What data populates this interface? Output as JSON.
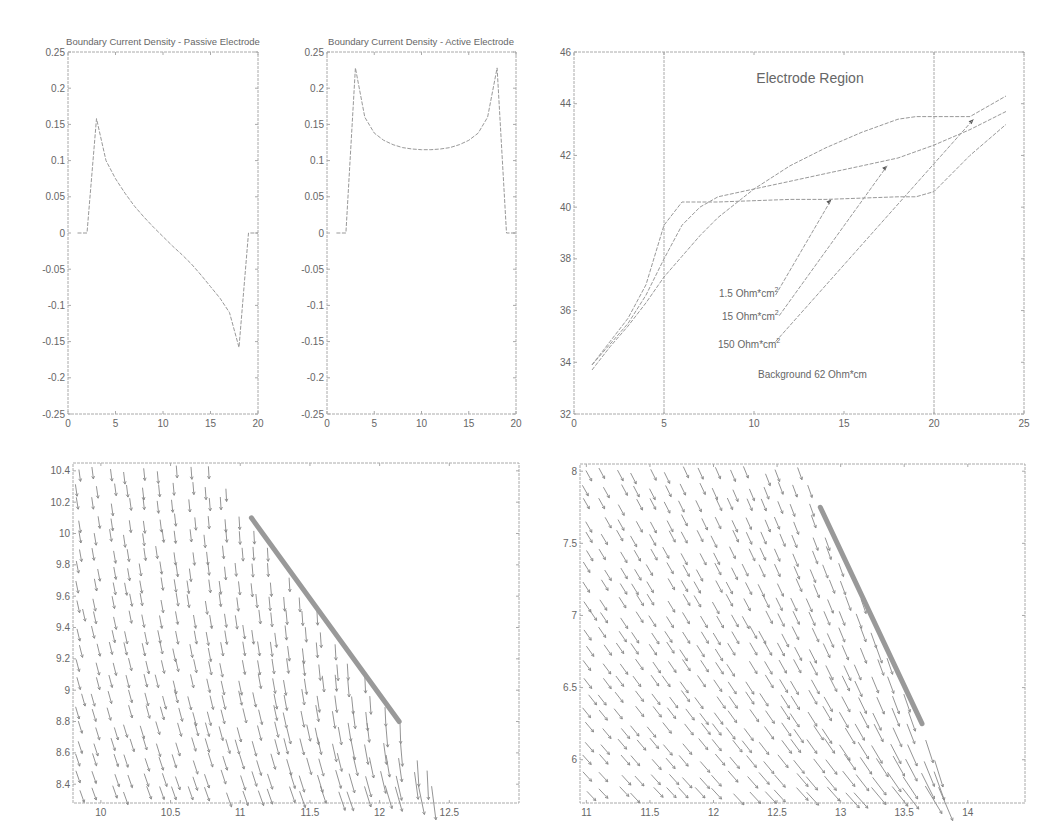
{
  "colors": {
    "background": "#ffffff",
    "axes": "#aaaaaa",
    "text": "#666666",
    "curve": "#999999",
    "electrode": "#999999"
  },
  "chart_data": [
    {
      "id": "passive",
      "type": "line",
      "title": "Boundary Current Density - Passive Electrode",
      "xlabel": "",
      "ylabel": "",
      "xlim": [
        0,
        20
      ],
      "ylim": [
        -0.25,
        0.25
      ],
      "xticks": [
        "0",
        "5",
        "10",
        "15",
        "20"
      ],
      "yticks": [
        "0.25",
        "0.2",
        "0.15",
        "0.1",
        "0.05",
        "0",
        "-0.05",
        "-0.1",
        "-0.15",
        "-0.2",
        "-0.25"
      ],
      "grid": false,
      "series": [
        {
          "name": "passive",
          "x": [
            1,
            2,
            3,
            4,
            5,
            6,
            7,
            8,
            9,
            10,
            11,
            12,
            13,
            14,
            15,
            16,
            17,
            18,
            19,
            20
          ],
          "y": [
            0,
            0,
            0.158,
            0.1,
            0.075,
            0.055,
            0.037,
            0.022,
            0.008,
            -0.005,
            -0.018,
            -0.03,
            -0.043,
            -0.058,
            -0.074,
            -0.09,
            -0.11,
            -0.158,
            0,
            0
          ]
        }
      ]
    },
    {
      "id": "active",
      "type": "line",
      "title": "Boundary Current Density - Active Electrode",
      "xlabel": "",
      "ylabel": "",
      "xlim": [
        0,
        20
      ],
      "ylim": [
        -0.25,
        0.25
      ],
      "xticks": [
        "0",
        "5",
        "10",
        "15",
        "20"
      ],
      "yticks": [
        "0.25",
        "0.2",
        "0.15",
        "0.1",
        "0.05",
        "0",
        "-0.05",
        "-0.1",
        "-0.15",
        "-0.2",
        "-0.25"
      ],
      "grid": false,
      "series": [
        {
          "name": "active",
          "x": [
            1,
            2,
            3,
            4,
            5,
            6,
            7,
            8,
            9,
            10,
            11,
            12,
            13,
            14,
            15,
            16,
            17,
            18,
            19,
            20
          ],
          "y": [
            0,
            0,
            0.228,
            0.16,
            0.138,
            0.128,
            0.122,
            0.118,
            0.116,
            0.115,
            0.115,
            0.116,
            0.118,
            0.122,
            0.128,
            0.138,
            0.16,
            0.228,
            0,
            0
          ]
        }
      ]
    },
    {
      "id": "electrode-region",
      "type": "line",
      "title": "Electrode Region",
      "xlabel": "",
      "ylabel": "",
      "xlim": [
        0,
        25
      ],
      "ylim": [
        32,
        46
      ],
      "xticks": [
        "0",
        "5",
        "10",
        "15",
        "20",
        "25"
      ],
      "yticks": [
        "46",
        "44",
        "42",
        "40",
        "38",
        "36",
        "34",
        "32"
      ],
      "grid": false,
      "vlines": [
        5,
        20
      ],
      "annotations": [
        {
          "text": "1.5 Ohm*cm",
          "sup": "2",
          "x": 7.6,
          "y": 36.8
        },
        {
          "text": "15 Ohm*cm",
          "sup": "2",
          "x": 7.8,
          "y": 36.0
        },
        {
          "text": "150 Ohm*cm",
          "sup": "2",
          "x": 7.6,
          "y": 35.0
        },
        {
          "text": "Background 62 Ohm*cm",
          "sup": "",
          "x": 10.5,
          "y": 33.8
        }
      ],
      "series": [
        {
          "name": "1.5 Ohm*cm^2",
          "x": [
            1,
            2,
            3,
            4,
            5,
            6,
            8,
            10,
            12,
            14,
            16,
            18,
            19,
            20,
            22,
            24
          ],
          "y": [
            33.9,
            34.8,
            35.7,
            37.0,
            39.3,
            40.2,
            40.2,
            40.25,
            40.3,
            40.3,
            40.35,
            40.4,
            40.4,
            40.6,
            42.0,
            43.2
          ]
        },
        {
          "name": "15 Ohm*cm^2",
          "x": [
            1,
            2,
            3,
            4,
            5,
            6,
            7,
            8,
            10,
            12,
            14,
            16,
            18,
            20,
            22,
            24
          ],
          "y": [
            33.9,
            34.7,
            35.5,
            36.6,
            38.0,
            39.3,
            40.0,
            40.4,
            40.7,
            41.0,
            41.3,
            41.6,
            41.9,
            42.4,
            43.0,
            43.7
          ]
        },
        {
          "name": "150 Ohm*cm^2",
          "x": [
            1,
            2,
            3,
            4,
            5,
            6,
            7,
            8,
            10,
            12,
            14,
            16,
            18,
            19,
            20,
            22,
            24
          ],
          "y": [
            33.7,
            34.6,
            35.4,
            36.3,
            37.3,
            38.1,
            38.9,
            39.6,
            40.7,
            41.6,
            42.3,
            42.9,
            43.4,
            43.5,
            43.5,
            43.5,
            44.3
          ]
        }
      ]
    },
    {
      "id": "quiver-left",
      "type": "quiver",
      "title": "",
      "xlim": [
        9.8,
        13.0
      ],
      "ylim": [
        8.28,
        10.45
      ],
      "xticks": [
        "10",
        "10.5",
        "11",
        "11.5",
        "12",
        "12.5"
      ],
      "yticks": [
        "10.4",
        "10.2",
        "10",
        "9.8",
        "9.6",
        "9.4",
        "9.2",
        "9",
        "8.8",
        "8.6",
        "8.4"
      ],
      "electrode_segment": {
        "x1": 11.08,
        "y1": 10.1,
        "x2": 12.14,
        "y2": 8.8
      },
      "field_description": "current density vectors pointing down/left, converging toward electrode end near (12.5, 8.28)"
    },
    {
      "id": "quiver-right",
      "type": "quiver",
      "title": "",
      "xlim": [
        10.95,
        14.45
      ],
      "ylim": [
        5.7,
        8.05
      ],
      "xticks": [
        "11",
        "11.5",
        "12",
        "12.5",
        "13",
        "13.5",
        "14"
      ],
      "yticks": [
        "8",
        "7.5",
        "7",
        "6.5",
        "6"
      ],
      "electrode_segment": {
        "x1": 12.84,
        "y1": 7.75,
        "x2": 13.64,
        "y2": 6.25
      },
      "field_description": "current density vectors pointing down/right, converging toward electrode end near (13.85, 5.7)"
    }
  ],
  "panels": {
    "passive": {
      "title": "Boundary Current Density - Passive Electrode"
    },
    "active": {
      "title": "Boundary Current Density - Active Electrode"
    },
    "region": {
      "title": "Electrode Region",
      "labels": {
        "l1": "1.5 Ohm*cm",
        "l2": "15 Ohm*cm",
        "l3": "150 Ohm*cm",
        "sup": "2",
        "bg": "Background 62 Ohm*cm"
      }
    }
  }
}
